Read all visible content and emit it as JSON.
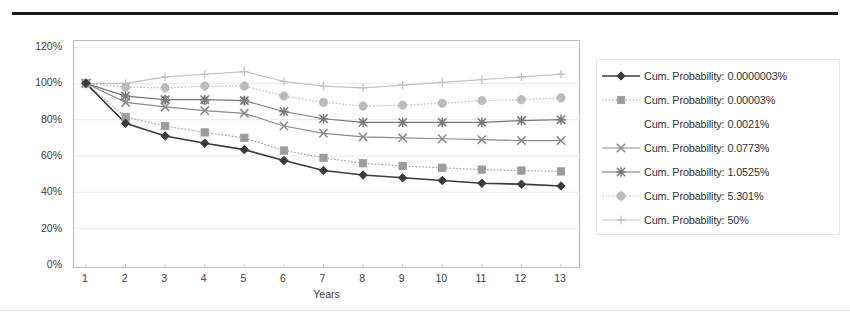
{
  "chart_data": {
    "type": "line",
    "title": "",
    "subtitle": "",
    "xlabel": "Years",
    "ylabel": "",
    "x": [
      1,
      2,
      3,
      4,
      5,
      6,
      7,
      8,
      9,
      10,
      11,
      12,
      13
    ],
    "xtick_labels": [
      "1",
      "2",
      "3",
      "4",
      "5",
      "6",
      "7",
      "8",
      "9",
      "10",
      "11",
      "12",
      "13"
    ],
    "ytick_labels": [
      "0%",
      "20%",
      "40%",
      "60%",
      "80%",
      "100%",
      "120%"
    ],
    "ytick_values": [
      0,
      20,
      40,
      60,
      80,
      100,
      120
    ],
    "ylim": [
      0,
      120
    ],
    "xlim": [
      1,
      13
    ],
    "grid": "horizontal",
    "legend_position": "right",
    "series": [
      {
        "name": "Cum. Probability: 0.0000003%",
        "marker": "diamond",
        "line_style": "solid",
        "color": "#3b3b3b",
        "values": [
          100,
          78,
          71,
          67,
          63.5,
          57.5,
          52,
          49.5,
          48,
          46.5,
          45,
          44.5,
          43.5
        ]
      },
      {
        "name": "Cum. Probability: 0.00003%",
        "marker": "square",
        "line_style": "dotted",
        "color": "#9c9c9c",
        "values": [
          100,
          81.5,
          76.5,
          73,
          70,
          63,
          59,
          56,
          54.5,
          53.5,
          52.5,
          52,
          51.5
        ]
      },
      {
        "name": "Cum. Probability: 0.0021%",
        "marker": "circle-open",
        "line_style": "none",
        "color": "#8e8e8e",
        "values": [
          100,
          92,
          91,
          90.5,
          90.5,
          84.5,
          80.5,
          78.5,
          78.5,
          78.5,
          78.5,
          79.5,
          80
        ]
      },
      {
        "name": "Cum. Probability: 0.0773%",
        "marker": "x",
        "line_style": "solid",
        "color": "#8a8a8a",
        "values": [
          100,
          89.5,
          87,
          85,
          83.5,
          76.5,
          72.5,
          70.5,
          70,
          69.5,
          69,
          68.5,
          68.5
        ]
      },
      {
        "name": "Cum. Probability: 1.0525%",
        "marker": "asterisk",
        "line_style": "solid",
        "color": "#787878",
        "values": [
          100,
          93,
          91,
          91,
          90.5,
          84.5,
          80.5,
          78.5,
          78.5,
          78.5,
          78.5,
          79.5,
          80
        ]
      },
      {
        "name": "Cum. Probability: 5.301%",
        "marker": "circle",
        "line_style": "dotted",
        "color": "#bcbcbc",
        "values": [
          100,
          98,
          97.5,
          98.5,
          98.5,
          93,
          89.5,
          87.5,
          88,
          89,
          90.5,
          91,
          92
        ]
      },
      {
        "name": "Cum. Probability: 50%",
        "marker": "plus",
        "line_style": "solid",
        "color": "#c2c2c2",
        "values": [
          100,
          100,
          103.5,
          105,
          106.5,
          101,
          98.5,
          97.5,
          99,
          100.5,
          102,
          103.5,
          105
        ]
      }
    ]
  },
  "legend": {
    "items": [
      {
        "label": "Cum. Probability: 0.0000003%"
      },
      {
        "label": "Cum. Probability: 0.00003%"
      },
      {
        "label": "Cum. Probability: 0.0021%"
      },
      {
        "label": "Cum. Probability: 0.0773%"
      },
      {
        "label": "Cum. Probability: 1.0525%"
      },
      {
        "label": "Cum. Probability: 5.301%"
      },
      {
        "label": "Cum. Probability: 50%"
      }
    ]
  },
  "axis": {
    "x_title": "Years",
    "y_ticks": [
      "120%",
      "100%",
      "80%",
      "60%",
      "40%",
      "20%",
      "0%"
    ],
    "x_ticks": [
      "1",
      "2",
      "3",
      "4",
      "5",
      "6",
      "7",
      "8",
      "9",
      "10",
      "11",
      "12",
      "13"
    ]
  },
  "colors": {
    "frame": "#b9b9b9",
    "grid": "#e8e8e8",
    "top_rule": "#1b1b1b",
    "text": "#3c3c3c"
  }
}
